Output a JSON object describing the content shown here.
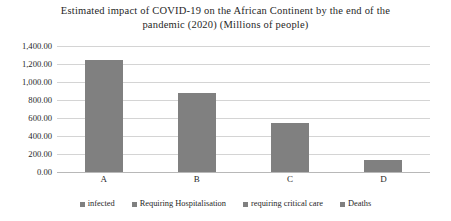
{
  "chart_data": {
    "type": "bar",
    "title": "Estimated impact of COVID-19 on the African Continent by the end of the pandemic (2020) (Millions of people)",
    "title_line1": "Estimated impact of COVID-19 on the African Continent by the end of the",
    "title_line2": "pandemic (2020) (Millions of people)",
    "categories": [
      "A",
      "B",
      "C",
      "D"
    ],
    "values": [
      1250,
      880,
      540,
      130
    ],
    "series": [
      {
        "name": "infected",
        "values": [
          1250,
          880,
          540,
          130
        ]
      }
    ],
    "legend": [
      "infected",
      "Requiring Hospitalisation",
      "requiring critical care",
      "Deaths"
    ],
    "legend_position": "bottom",
    "xlabel": "",
    "ylabel": "",
    "ylim": [
      0,
      1400
    ],
    "ytick_step": 200,
    "ytick_labels": [
      "1,400.00",
      "1,200.00",
      "1,000.00",
      "800.00",
      "600.00",
      "400.00",
      "200.00",
      "0.00"
    ],
    "ytick_values": [
      1400,
      1200,
      1000,
      800,
      600,
      400,
      200,
      0
    ],
    "grid": true,
    "bar_color": "#808080",
    "gridline_color": "#d4d4d4",
    "background": "#ffffff"
  }
}
